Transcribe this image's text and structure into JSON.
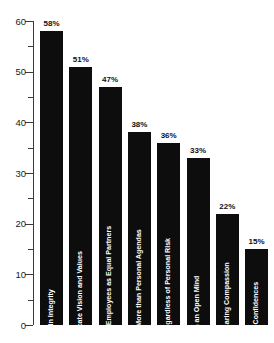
{
  "chart_data": {
    "type": "bar",
    "title": "",
    "subtitle": "",
    "xlabel": "",
    "ylabel": "",
    "ylim": [
      0,
      60
    ],
    "y_major_ticks": [
      0,
      10,
      20,
      30,
      40,
      50,
      60
    ],
    "y_minor_ticks": [
      5,
      15,
      25,
      35,
      45,
      55
    ],
    "grid": false,
    "legend": "none",
    "orientation": "vertical",
    "bar_color": "#0d0d0d",
    "label_color": "#ffffff",
    "categories": [
      "Maintain Integrity",
      "Openly Communicate Vision and Values",
      "Show Respect for Fellow Employees as Equal Partners",
      "Focus on Shared Goals More than Personal Agendas",
      "Do the Right Thing Regardless of Personal Risk",
      "Listen with an Open Mind",
      "Demonstrate Caring Compassion",
      "Maintain Confidences"
    ],
    "values": [
      58,
      51,
      47,
      38,
      36,
      33,
      22,
      15
    ],
    "value_labels": [
      "58%",
      "51%",
      "47%",
      "38%",
      "36%",
      "33%",
      "22%",
      "15%"
    ],
    "tick_labels": [
      "0",
      "10",
      "20",
      "30",
      "40",
      "50",
      "60"
    ]
  }
}
